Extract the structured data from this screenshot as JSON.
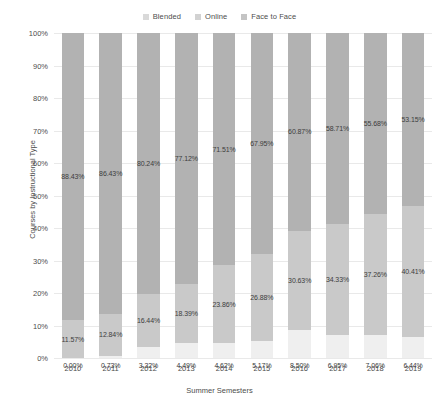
{
  "chart_data": {
    "type": "bar",
    "subtype": "stacked-100-percent",
    "title": "",
    "xlabel": "Summer Semesters",
    "ylabel": "Courses by Instructional Type",
    "categories": [
      "2010",
      "2011",
      "2012",
      "2013",
      "2014",
      "2015",
      "2016",
      "2017",
      "2018",
      "2019"
    ],
    "ylim": [
      0,
      100
    ],
    "ytick_labels": [
      "0%",
      "10%",
      "20%",
      "30%",
      "40%",
      "50%",
      "60%",
      "70%",
      "80%",
      "90%",
      "100%"
    ],
    "ytick_values": [
      0,
      10,
      20,
      30,
      40,
      50,
      60,
      70,
      80,
      90,
      100
    ],
    "grid": true,
    "legend_position": "top-center",
    "series": [
      {
        "name": "Blended",
        "color": "#efefef",
        "values": [
          0.0,
          0.73,
          3.32,
          4.49,
          4.62,
          5.17,
          8.5,
          6.95,
          7.06,
          6.44
        ],
        "labels": [
          "0.00%",
          "0.73%",
          "3.32%",
          "4.49%",
          "4.62%",
          "5.17%",
          "8.50%",
          "6.95%",
          "7.06%",
          "6.44%"
        ]
      },
      {
        "name": "Online",
        "color": "#c9c9c9",
        "values": [
          11.57,
          12.84,
          16.44,
          18.39,
          23.86,
          26.88,
          30.63,
          34.33,
          37.26,
          40.41
        ],
        "labels": [
          "11.57%",
          "12.84%",
          "16.44%",
          "18.39%",
          "23.86%",
          "26.88%",
          "30.63%",
          "34.33%",
          "37.26%",
          "40.41%"
        ]
      },
      {
        "name": "Face to Face",
        "color": "#b2b2b2",
        "values": [
          88.43,
          86.43,
          80.24,
          77.12,
          71.51,
          67.95,
          60.87,
          58.71,
          55.68,
          53.15
        ],
        "labels": [
          "88.43%",
          "86.43%",
          "80.24%",
          "77.12%",
          "71.51%",
          "67.95%",
          "60.87%",
          "58.71%",
          "55.68%",
          "53.15%"
        ]
      }
    ]
  },
  "legend": {
    "items": [
      {
        "label": "Blended",
        "color": "#d9d9d9"
      },
      {
        "label": "Online",
        "color": "#d2d2d2"
      },
      {
        "label": "Face to Face",
        "color": "#c4c4c4"
      }
    ]
  }
}
